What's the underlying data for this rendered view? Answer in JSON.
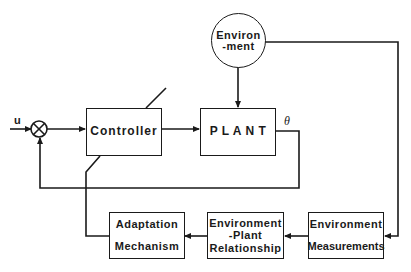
{
  "diagram": {
    "type": "block-diagram",
    "title": "",
    "input_label": "u",
    "output_label": "θ",
    "summing_junction": {
      "symbol": "⊗",
      "sign_feedback": "-"
    },
    "blocks": {
      "controller": {
        "lines": [
          "Controller"
        ]
      },
      "plant": {
        "lines": [
          "P L A N T"
        ]
      },
      "environment": {
        "lines": [
          "Environ",
          "-ment"
        ]
      },
      "adaptation_mechanism": {
        "lines": [
          "Adaptation",
          "Mechanism"
        ]
      },
      "environment_plant_relationship": {
        "lines": [
          "Environment",
          "-Plant",
          "Relationship"
        ]
      },
      "environment_measurements": {
        "lines": [
          "Environment",
          "Measurements"
        ]
      }
    },
    "connections": [
      {
        "from": "u",
        "to": "summing_junction"
      },
      {
        "from": "summing_junction",
        "to": "controller"
      },
      {
        "from": "controller",
        "to": "plant"
      },
      {
        "from": "environment",
        "to": "plant"
      },
      {
        "from": "plant",
        "to": "summing_junction",
        "label": "θ",
        "kind": "feedback"
      },
      {
        "from": "environment",
        "to": "environment_measurements"
      },
      {
        "from": "environment_measurements",
        "to": "environment_plant_relationship"
      },
      {
        "from": "environment_plant_relationship",
        "to": "adaptation_mechanism"
      },
      {
        "from": "adaptation_mechanism",
        "to": "controller",
        "kind": "adjustment"
      }
    ]
  }
}
